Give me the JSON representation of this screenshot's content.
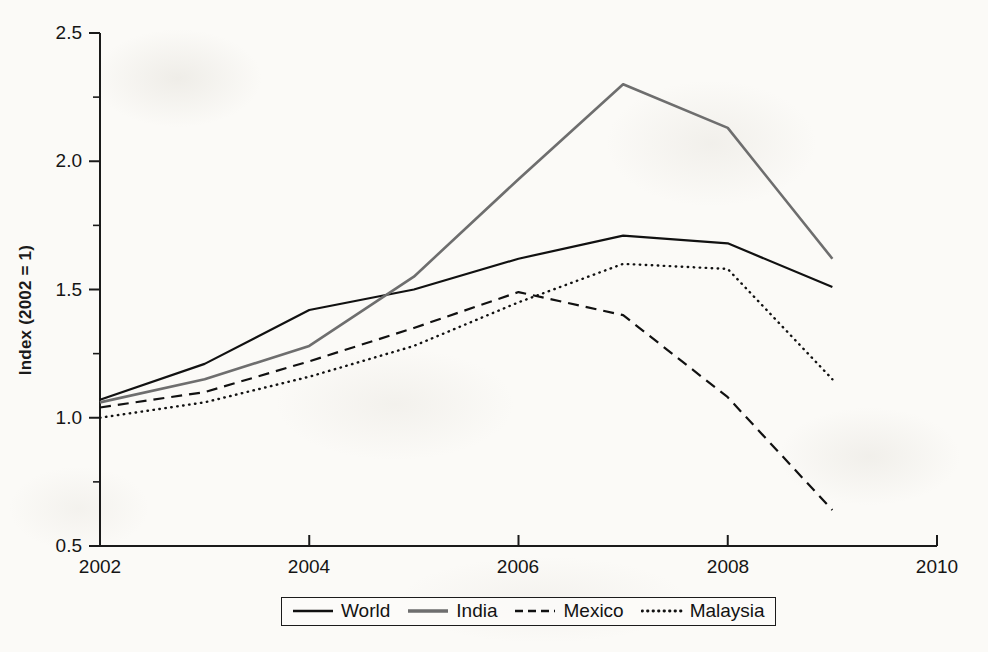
{
  "chart_data": {
    "type": "line",
    "title": "",
    "subtitle": "",
    "xlabel": "",
    "ylabel": "Index (2002 = 1)",
    "xlim": [
      2002,
      2010
    ],
    "ylim": [
      0.5,
      2.5
    ],
    "xticks": [
      2002,
      2004,
      2006,
      2008,
      2010
    ],
    "xtick_labels": [
      "2002",
      "2004",
      "2006",
      "2008",
      "2010"
    ],
    "yticks": [
      0.5,
      1.0,
      1.5,
      2.0,
      2.5
    ],
    "ytick_labels": [
      "0.5",
      "1.0",
      "1.5",
      "2.0",
      "2.5"
    ],
    "minor_yticks": [
      0.75,
      1.25,
      1.75,
      2.25
    ],
    "grid": false,
    "legend_position": "bottom-center",
    "x": [
      2002,
      2003,
      2004,
      2005,
      2006,
      2007,
      2008,
      2009
    ],
    "series": [
      {
        "name": "World",
        "style": "solid",
        "color": "#111111",
        "width": 2.2,
        "values": [
          1.07,
          1.21,
          1.42,
          1.5,
          1.62,
          1.71,
          1.68,
          1.51
        ]
      },
      {
        "name": "India",
        "style": "solid",
        "color": "#6e6e6e",
        "width": 2.6,
        "values": [
          1.06,
          1.15,
          1.28,
          1.55,
          1.93,
          2.3,
          2.13,
          1.62
        ]
      },
      {
        "name": "Mexico",
        "style": "dashed",
        "color": "#111111",
        "width": 2.2,
        "values": [
          1.04,
          1.1,
          1.22,
          1.35,
          1.49,
          1.4,
          1.08,
          0.64
        ]
      },
      {
        "name": "Malaysia",
        "style": "dotted",
        "color": "#111111",
        "width": 2.4,
        "values": [
          1.0,
          1.06,
          1.16,
          1.28,
          1.45,
          1.6,
          1.58,
          1.15
        ]
      }
    ]
  },
  "axes": {
    "y_title": "Index (2002 = 1)",
    "y_labels": [
      "2.5",
      "2.0",
      "1.5",
      "1.0",
      "0.5"
    ],
    "x_labels": [
      "2002",
      "2004",
      "2006",
      "2008",
      "2010"
    ]
  },
  "legend": {
    "entries": [
      {
        "label": "World",
        "style": "solid",
        "color": "#111111"
      },
      {
        "label": "India",
        "style": "solid",
        "color": "#6e6e6e"
      },
      {
        "label": "Mexico",
        "style": "dashed",
        "color": "#111111"
      },
      {
        "label": "Malaysia",
        "style": "dotted",
        "color": "#111111"
      }
    ]
  },
  "colors": {
    "axis": "#1a1a1a",
    "world": "#111111",
    "india": "#6e6e6e",
    "mexico": "#111111",
    "malaysia": "#111111",
    "background": "#fbfaf7"
  }
}
